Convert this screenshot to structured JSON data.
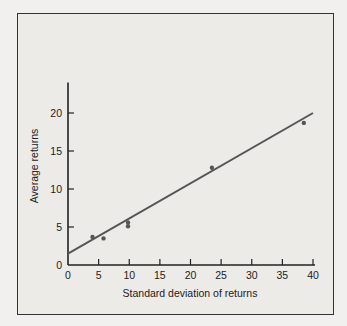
{
  "chart_data": {
    "type": "scatter",
    "title": "",
    "xlabel": "Standard deviation of returns",
    "ylabel": "Average returns",
    "xlim": [
      0,
      40
    ],
    "ylim": [
      0,
      24
    ],
    "xticks": [
      0,
      5,
      10,
      15,
      20,
      25,
      30,
      35,
      40
    ],
    "yticks": [
      0,
      5,
      10,
      15,
      20
    ],
    "grid": false,
    "legend": null,
    "series": [
      {
        "name": "observations",
        "type": "scatter",
        "x": [
          4.0,
          5.8,
          9.8,
          9.8,
          23.5,
          38.5
        ],
        "y": [
          3.7,
          3.5,
          5.1,
          5.6,
          12.8,
          18.7
        ]
      },
      {
        "name": "fitted line",
        "type": "line",
        "x": [
          0,
          40
        ],
        "y": [
          1.5,
          20.0
        ]
      }
    ]
  }
}
